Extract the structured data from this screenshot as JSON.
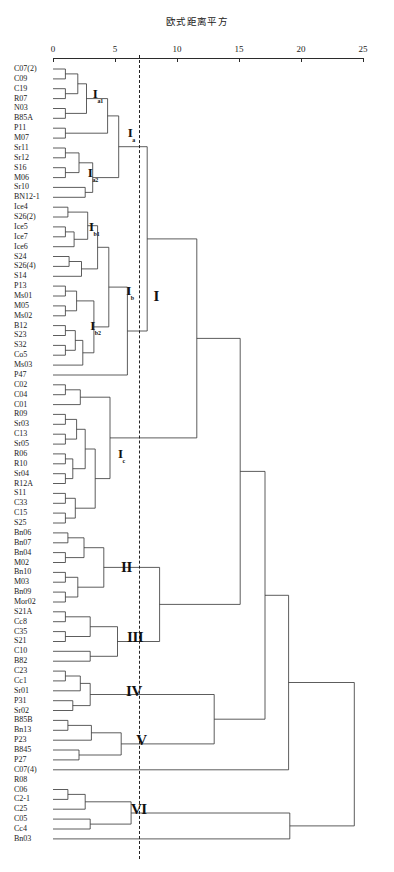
{
  "chart_data": {
    "type": "dendrogram",
    "title": "欧式距离平方",
    "xlabel": "欧式距离平方",
    "ylabel": "",
    "xlim": [
      0,
      25
    ],
    "xticks": [
      0,
      5,
      10,
      15,
      20,
      25
    ],
    "xtick_labels": [
      "0",
      "5",
      "10",
      "15",
      "20",
      "25"
    ],
    "grid": false,
    "legend": null,
    "cut_line": {
      "value": 6.9,
      "style": "dashed"
    },
    "leaf_labels": [
      "C07(2)",
      "C09",
      "C19",
      "R07",
      "N03",
      "B85A",
      "P11",
      "M07",
      "Sr11",
      "Sr12",
      "S16",
      "M06",
      "Sr10",
      "BN12-1",
      "Ice4",
      "S26(2)",
      "Ice5",
      "Ice7",
      "Ice6",
      "S24",
      "S26(4)",
      "S14",
      "P13",
      "Ms01",
      "M05",
      "Ms02",
      "B12",
      "S23",
      "S32",
      "Co5",
      "Ms03",
      "P47",
      "C02",
      "C04",
      "C01",
      "R09",
      "Sr03",
      "C13",
      "Sr05",
      "R06",
      "R10",
      "Sr04",
      "R12A",
      "S11",
      "C33",
      "C15",
      "S25",
      "Bn06",
      "Bn07",
      "Bn04",
      "M02",
      "Bn10",
      "M03",
      "Bn09",
      "Mor02",
      "S21A",
      "Cc8",
      "C35",
      "S21",
      "C10",
      "B82",
      "C23",
      "Cc1",
      "Sr01",
      "P31",
      "Sr02",
      "B85B",
      "Bn13",
      "P23",
      "B845",
      "P27",
      "C07(4)",
      "R08",
      "C06",
      "C2-1",
      "C25",
      "C05",
      "Cc4",
      "Bn03"
    ],
    "clusters": [
      {
        "name": "I",
        "sub": "a1",
        "x": 3.3,
        "leaf_from": 0,
        "leaf_to": 5
      },
      {
        "name": "I",
        "sub": "a2",
        "x": 2.9,
        "leaf_from": 8,
        "leaf_to": 13
      },
      {
        "name": "I",
        "sub": "a",
        "x": 6.0,
        "leaf_from": 0,
        "leaf_to": 13
      },
      {
        "name": "I",
        "sub": "b1",
        "x": 3.0,
        "leaf_from": 14,
        "leaf_to": 18
      },
      {
        "name": "I",
        "sub": "b2",
        "x": 3.1,
        "leaf_from": 22,
        "leaf_to": 30
      },
      {
        "name": "I",
        "sub": "b",
        "x": 5.9,
        "leaf_from": 14,
        "leaf_to": 31
      },
      {
        "name": "I",
        "sub": "c",
        "x": 5.2,
        "leaf_from": 32,
        "leaf_to": 46
      },
      {
        "name": "I",
        "sub": "",
        "x": 8.0,
        "leaf_from": 0,
        "leaf_to": 46
      },
      {
        "name": "II",
        "sub": "",
        "x": 5.6,
        "leaf_from": 47,
        "leaf_to": 54
      },
      {
        "name": "III",
        "sub": "",
        "x": 6.3,
        "leaf_from": 55,
        "leaf_to": 60
      },
      {
        "name": "IV",
        "sub": "",
        "x": 6.2,
        "leaf_from": 61,
        "leaf_to": 65
      },
      {
        "name": "V",
        "sub": "",
        "x": 6.8,
        "leaf_from": 66,
        "leaf_to": 70
      },
      {
        "name": "VI",
        "sub": "",
        "x": 6.6,
        "leaf_from": 73,
        "leaf_to": 77
      }
    ],
    "merges": [
      {
        "id": "m1",
        "left": {
          "leaf": 0
        },
        "right": {
          "leaf": 1
        },
        "height": 1.0
      },
      {
        "id": "m2",
        "left": {
          "leaf": 2
        },
        "right": {
          "leaf": 3
        },
        "height": 1.0
      },
      {
        "id": "m3",
        "left": {
          "node": "m1"
        },
        "right": {
          "node": "m2"
        },
        "height": 2.0
      },
      {
        "id": "m4",
        "left": {
          "leaf": 4
        },
        "right": {
          "leaf": 5
        },
        "height": 1.0
      },
      {
        "id": "m5",
        "left": {
          "node": "m3"
        },
        "right": {
          "node": "m4"
        },
        "height": 2.7
      },
      {
        "id": "m6",
        "left": {
          "leaf": 6
        },
        "right": {
          "leaf": 7
        },
        "height": 1.0
      },
      {
        "id": "m7",
        "left": {
          "node": "m5"
        },
        "right": {
          "node": "m6"
        },
        "height": 4.4
      },
      {
        "id": "m8",
        "left": {
          "leaf": 8
        },
        "right": {
          "leaf": 9
        },
        "height": 1.0
      },
      {
        "id": "m9",
        "left": {
          "leaf": 10
        },
        "right": {
          "leaf": 11
        },
        "height": 1.0
      },
      {
        "id": "m10",
        "left": {
          "node": "m8"
        },
        "right": {
          "node": "m9"
        },
        "height": 2.1
      },
      {
        "id": "m11",
        "left": {
          "leaf": 12
        },
        "right": {
          "leaf": 13
        },
        "height": 2.6
      },
      {
        "id": "m12",
        "left": {
          "node": "m10"
        },
        "right": {
          "node": "m11"
        },
        "height": 3.2
      },
      {
        "id": "m13",
        "left": {
          "node": "m7"
        },
        "right": {
          "node": "m12"
        },
        "height": 5.3
      },
      {
        "id": "m14",
        "left": {
          "leaf": 14
        },
        "right": {
          "leaf": 15
        },
        "height": 1.2
      },
      {
        "id": "m15",
        "left": {
          "leaf": 16
        },
        "right": {
          "leaf": 17
        },
        "height": 1.0
      },
      {
        "id": "m16",
        "left": {
          "node": "m15"
        },
        "right": {
          "leaf": 18
        },
        "height": 1.7
      },
      {
        "id": "m17",
        "left": {
          "node": "m14"
        },
        "right": {
          "node": "m16"
        },
        "height": 2.8
      },
      {
        "id": "m18",
        "left": {
          "leaf": 19
        },
        "right": {
          "leaf": 20
        },
        "height": 1.3
      },
      {
        "id": "m19",
        "left": {
          "node": "m18"
        },
        "right": {
          "leaf": 21
        },
        "height": 2.3
      },
      {
        "id": "m20",
        "left": {
          "node": "m17"
        },
        "right": {
          "node": "m19"
        },
        "height": 3.6
      },
      {
        "id": "m21",
        "left": {
          "leaf": 22
        },
        "right": {
          "leaf": 23
        },
        "height": 1.0
      },
      {
        "id": "m22",
        "left": {
          "leaf": 24
        },
        "right": {
          "leaf": 25
        },
        "height": 1.0
      },
      {
        "id": "m23",
        "left": {
          "node": "m21"
        },
        "right": {
          "node": "m22"
        },
        "height": 1.9
      },
      {
        "id": "m24",
        "left": {
          "leaf": 26
        },
        "right": {
          "leaf": 27
        },
        "height": 1.0
      },
      {
        "id": "m25",
        "left": {
          "leaf": 28
        },
        "right": {
          "leaf": 29
        },
        "height": 1.0
      },
      {
        "id": "m26",
        "left": {
          "node": "m24"
        },
        "right": {
          "node": "m25"
        },
        "height": 1.8
      },
      {
        "id": "m27",
        "left": {
          "node": "m26"
        },
        "right": {
          "leaf": 30
        },
        "height": 2.4
      },
      {
        "id": "m28",
        "left": {
          "node": "m23"
        },
        "right": {
          "node": "m27"
        },
        "height": 3.3
      },
      {
        "id": "m29",
        "left": {
          "node": "m20"
        },
        "right": {
          "node": "m28"
        },
        "height": 4.5
      },
      {
        "id": "m30",
        "left": {
          "node": "m29"
        },
        "right": {
          "leaf": 31
        },
        "height": 6.0
      },
      {
        "id": "m31",
        "left": {
          "node": "m13"
        },
        "right": {
          "node": "m30"
        },
        "height": 7.6
      },
      {
        "id": "m32",
        "left": {
          "leaf": 32
        },
        "right": {
          "leaf": 33
        },
        "height": 1.0
      },
      {
        "id": "m33",
        "left": {
          "node": "m32"
        },
        "right": {
          "leaf": 34
        },
        "height": 2.2
      },
      {
        "id": "m34",
        "left": {
          "leaf": 35
        },
        "right": {
          "leaf": 36
        },
        "height": 1.0
      },
      {
        "id": "m35",
        "left": {
          "leaf": 37
        },
        "right": {
          "leaf": 38
        },
        "height": 1.0
      },
      {
        "id": "m36",
        "left": {
          "node": "m34"
        },
        "right": {
          "node": "m35"
        },
        "height": 1.9
      },
      {
        "id": "m37",
        "left": {
          "leaf": 39
        },
        "right": {
          "leaf": 40
        },
        "height": 1.0
      },
      {
        "id": "m38",
        "left": {
          "leaf": 41
        },
        "right": {
          "leaf": 42
        },
        "height": 1.0
      },
      {
        "id": "m39",
        "left": {
          "node": "m37"
        },
        "right": {
          "node": "m38"
        },
        "height": 1.6
      },
      {
        "id": "m40",
        "left": {
          "node": "m36"
        },
        "right": {
          "node": "m39"
        },
        "height": 2.6
      },
      {
        "id": "m41",
        "left": {
          "leaf": 43
        },
        "right": {
          "leaf": 44
        },
        "height": 1.0
      },
      {
        "id": "m42",
        "left": {
          "leaf": 45
        },
        "right": {
          "leaf": 46
        },
        "height": 1.0
      },
      {
        "id": "m43",
        "left": {
          "node": "m41"
        },
        "right": {
          "node": "m42"
        },
        "height": 1.8
      },
      {
        "id": "m44",
        "left": {
          "node": "m40"
        },
        "right": {
          "node": "m43"
        },
        "height": 3.4
      },
      {
        "id": "m45",
        "left": {
          "node": "m33"
        },
        "right": {
          "node": "m44"
        },
        "height": 4.6
      },
      {
        "id": "m46",
        "left": {
          "node": "m31"
        },
        "right": {
          "node": "m45"
        },
        "height": 11.6
      },
      {
        "id": "m47",
        "left": {
          "leaf": 47
        },
        "right": {
          "leaf": 48
        },
        "height": 1.2
      },
      {
        "id": "m48",
        "left": {
          "leaf": 49
        },
        "right": {
          "leaf": 50
        },
        "height": 1.0
      },
      {
        "id": "m49",
        "left": {
          "node": "m47"
        },
        "right": {
          "node": "m48"
        },
        "height": 2.5
      },
      {
        "id": "m50",
        "left": {
          "leaf": 51
        },
        "right": {
          "leaf": 52
        },
        "height": 1.0
      },
      {
        "id": "m51",
        "left": {
          "leaf": 53
        },
        "right": {
          "leaf": 54
        },
        "height": 1.0
      },
      {
        "id": "m52",
        "left": {
          "node": "m50"
        },
        "right": {
          "node": "m51"
        },
        "height": 2.0
      },
      {
        "id": "m53",
        "left": {
          "node": "m49"
        },
        "right": {
          "node": "m52"
        },
        "height": 4.1
      },
      {
        "id": "m54",
        "left": {
          "leaf": 55
        },
        "right": {
          "leaf": 56
        },
        "height": 1.0
      },
      {
        "id": "m55",
        "left": {
          "leaf": 57
        },
        "right": {
          "leaf": 58
        },
        "height": 1.0
      },
      {
        "id": "m56",
        "left": {
          "node": "m54"
        },
        "right": {
          "node": "m55"
        },
        "height": 3.0
      },
      {
        "id": "m57",
        "left": {
          "leaf": 59
        },
        "right": {
          "leaf": 60
        },
        "height": 3.0
      },
      {
        "id": "m58",
        "left": {
          "node": "m56"
        },
        "right": {
          "node": "m57"
        },
        "height": 5.2
      },
      {
        "id": "m59",
        "left": {
          "node": "m53"
        },
        "right": {
          "node": "m58"
        },
        "height": 8.6
      },
      {
        "id": "m60",
        "left": {
          "node": "m46"
        },
        "right": {
          "node": "m59"
        },
        "height": 15.1
      },
      {
        "id": "m61",
        "left": {
          "leaf": 61
        },
        "right": {
          "leaf": 62
        },
        "height": 1.0
      },
      {
        "id": "m62",
        "left": {
          "node": "m61"
        },
        "right": {
          "leaf": 63
        },
        "height": 2.2
      },
      {
        "id": "m63",
        "left": {
          "leaf": 64
        },
        "right": {
          "leaf": 65
        },
        "height": 1.6
      },
      {
        "id": "m64",
        "left": {
          "node": "m62"
        },
        "right": {
          "node": "m63"
        },
        "height": 3.0
      },
      {
        "id": "m65",
        "left": {
          "leaf": 66
        },
        "right": {
          "leaf": 67
        },
        "height": 1.2
      },
      {
        "id": "m66",
        "left": {
          "node": "m65"
        },
        "right": {
          "leaf": 68
        },
        "height": 3.1
      },
      {
        "id": "m67",
        "left": {
          "leaf": 69
        },
        "right": {
          "leaf": 70
        },
        "height": 2.1
      },
      {
        "id": "m68",
        "left": {
          "node": "m66"
        },
        "right": {
          "node": "m67"
        },
        "height": 5.5
      },
      {
        "id": "m69",
        "left": {
          "node": "m64"
        },
        "right": {
          "node": "m68"
        },
        "height": 13.0
      },
      {
        "id": "m70",
        "left": {
          "node": "m60"
        },
        "right": {
          "node": "m69"
        },
        "height": 17.1
      },
      {
        "id": "m71",
        "left": {
          "node": "m70"
        },
        "right": {
          "leaf": 71
        },
        "height": 19.0
      },
      {
        "id": "m72",
        "left": {
          "leaf": 73
        },
        "right": {
          "leaf": 74
        },
        "height": 1.2
      },
      {
        "id": "m73",
        "left": {
          "node": "m72"
        },
        "right": {
          "leaf": 75
        },
        "height": 2.6
      },
      {
        "id": "m74",
        "left": {
          "leaf": 76
        },
        "right": {
          "leaf": 77
        },
        "height": 3.0
      },
      {
        "id": "m75",
        "left": {
          "node": "m73"
        },
        "right": {
          "node": "m74"
        },
        "height": 6.3
      },
      {
        "id": "m76",
        "left": {
          "node": "m75"
        },
        "right": {
          "leaf": 78
        },
        "height": 19.1
      },
      {
        "id": "m77",
        "left": {
          "node": "m71"
        },
        "right": {
          "node": "m76"
        },
        "height": 24.3
      }
    ]
  }
}
